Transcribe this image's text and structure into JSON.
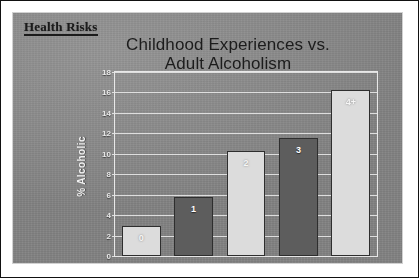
{
  "slide": {
    "header": "Health Risks",
    "background_color": "#8b8b8b"
  },
  "chart_data": {
    "type": "bar",
    "title": "Childhood Experiences vs. Adult Alcoholism",
    "title_line1": "Childhood Experiences vs.",
    "title_line2": "Adult Alcoholism",
    "xlabel": "",
    "ylabel": "% Alcoholic",
    "categories": [
      "0",
      "1",
      "2",
      "3",
      "4+"
    ],
    "values": [
      2.9,
      5.8,
      10.3,
      11.5,
      16.2
    ],
    "bar_labels": [
      "0",
      "1",
      "2",
      "3",
      "4+"
    ],
    "bar_colors": [
      "#dcdcdc",
      "#5d5d5d",
      "#dcdcdc",
      "#5d5d5d",
      "#dcdcdc"
    ],
    "ylim": [
      0,
      18
    ],
    "ytick_step": 2,
    "yticks": [
      "0",
      "2",
      "4",
      "6",
      "8",
      "10",
      "12",
      "14",
      "16",
      "18"
    ],
    "grid": true,
    "legend": false
  }
}
